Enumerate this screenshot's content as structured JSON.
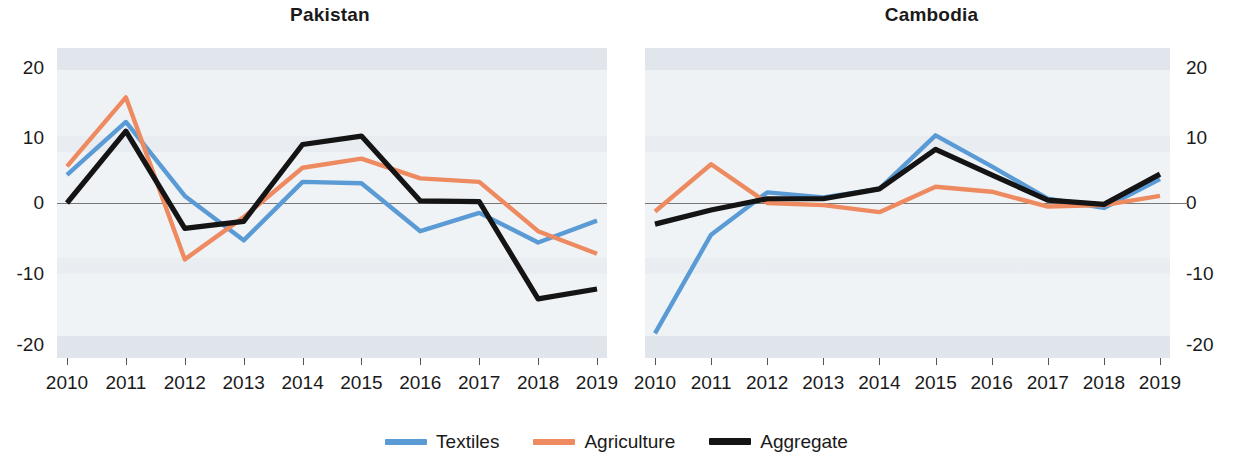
{
  "figure": {
    "background": "#ffffff",
    "plot_background": "#eef1f4"
  },
  "legend": {
    "position": "bottom-center",
    "items": [
      {
        "label": "Textiles",
        "color": "#5b9bd5",
        "name": "legend-textiles"
      },
      {
        "label": "Agriculture",
        "color": "#ee8a60",
        "name": "legend-agriculture"
      },
      {
        "label": "Aggregate",
        "color": "#141414",
        "name": "legend-aggregate"
      }
    ]
  },
  "panels": [
    {
      "title": "Pakistan"
    },
    {
      "title": "Cambodia"
    }
  ],
  "axis": {
    "yticks": [
      "20",
      "10",
      "0",
      "-10",
      "-20"
    ],
    "ytick_values": [
      20,
      10,
      0,
      -10,
      -20
    ],
    "ylim": [
      -22,
      22
    ],
    "xticks": [
      "2010",
      "2011",
      "2012",
      "2013",
      "2014",
      "2015",
      "2016",
      "2017",
      "2018",
      "2019"
    ]
  },
  "chart_data": [
    {
      "type": "line",
      "title": "Pakistan",
      "xlabel": "",
      "ylabel": "",
      "x": [
        2010,
        2011,
        2012,
        2013,
        2014,
        2015,
        2016,
        2017,
        2018,
        2019
      ],
      "categories": [
        "2010",
        "2011",
        "2012",
        "2013",
        "2014",
        "2015",
        "2016",
        "2017",
        "2018",
        "2019"
      ],
      "ylim": [
        -22,
        22
      ],
      "yticks": [
        -20,
        -10,
        0,
        10,
        20
      ],
      "grid": false,
      "zero_line": true,
      "legend": "bottom-center",
      "series": [
        {
          "name": "Textiles",
          "color": "#5b9bd5",
          "values": [
            4.0,
            11.5,
            1.0,
            -5.3,
            3.0,
            2.8,
            -4.0,
            -1.4,
            -5.6,
            -2.5
          ]
        },
        {
          "name": "Agriculture",
          "color": "#ee8a60",
          "values": [
            5.2,
            15.0,
            -8.0,
            -2.0,
            5.0,
            6.3,
            3.5,
            3.0,
            -4.0,
            -7.2
          ]
        },
        {
          "name": "Aggregate",
          "color": "#141414",
          "values": [
            0.0,
            10.2,
            -3.6,
            -2.6,
            8.3,
            9.5,
            0.3,
            0.2,
            -13.6,
            -12.2
          ]
        }
      ]
    },
    {
      "type": "line",
      "title": "Cambodia",
      "xlabel": "",
      "ylabel": "",
      "x": [
        2010,
        2011,
        2012,
        2013,
        2014,
        2015,
        2016,
        2017,
        2018,
        2019
      ],
      "categories": [
        "2010",
        "2011",
        "2012",
        "2013",
        "2014",
        "2015",
        "2016",
        "2017",
        "2018",
        "2019"
      ],
      "ylim": [
        -22,
        22
      ],
      "yticks": [
        -20,
        -10,
        0,
        10,
        20
      ],
      "grid": false,
      "zero_line": true,
      "legend": "bottom-center",
      "series": [
        {
          "name": "Textiles",
          "color": "#5b9bd5",
          "values": [
            -18.5,
            -4.5,
            1.5,
            0.8,
            2.0,
            9.6,
            5.2,
            0.6,
            -0.7,
            3.4
          ]
        },
        {
          "name": "Agriculture",
          "color": "#ee8a60",
          "values": [
            -1.2,
            5.5,
            0.0,
            -0.3,
            -1.3,
            2.3,
            1.6,
            -0.5,
            -0.3,
            1.0
          ]
        },
        {
          "name": "Aggregate",
          "color": "#141414",
          "values": [
            -3.0,
            -1.0,
            0.6,
            0.6,
            2.0,
            7.6,
            4.0,
            0.4,
            -0.2,
            4.1
          ]
        }
      ]
    }
  ]
}
